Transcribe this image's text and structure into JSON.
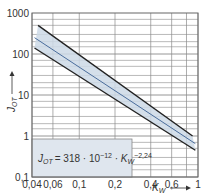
{
  "chart_data": {
    "type": "line",
    "title": "",
    "formula": {
      "lhs": "J",
      "lhs_sub": "OT",
      "text": "= 318 · 10",
      "exp1": "−12",
      "mid": " · K",
      "mid_sub": "W",
      "exp2": "−2,24"
    },
    "xlabel": "K",
    "xlabel_sub": "W",
    "ylabel": "J",
    "ylabel_sub": "OT",
    "xscale": "log",
    "yscale": "log",
    "xlim": [
      0.04,
      1
    ],
    "ylim": [
      0.1,
      1000
    ],
    "x_ticks": [
      "0,04",
      "0,06",
      "0,1",
      "0,2",
      "0,4",
      "0,6",
      "1"
    ],
    "y_ticks": [
      "0,1",
      "1",
      "10",
      "100",
      "1000"
    ],
    "grid": true,
    "series": [
      {
        "name": "upper bound",
        "x": [
          0.045,
          0.9
        ],
        "y": [
          500,
          1.0
        ],
        "color": "#222222"
      },
      {
        "name": "J_OT = 318·10^-12·K_W^-2.24 (mean)",
        "x": [
          0.042,
          0.95
        ],
        "y": [
          250,
          0.65
        ],
        "color": "#4a6d9c"
      },
      {
        "name": "lower bound",
        "x": [
          0.042,
          0.95
        ],
        "y": [
          140,
          0.45
        ],
        "color": "#222222"
      }
    ],
    "band_color": "#cdd9e6"
  },
  "arrows": {
    "x_arrow": "⟶",
    "y_arrow": "⟶"
  }
}
